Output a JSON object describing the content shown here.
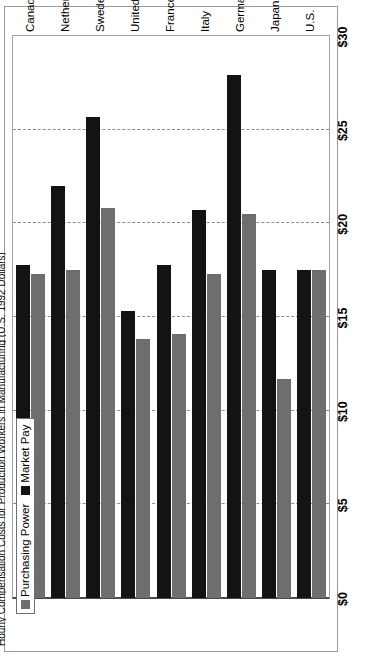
{
  "chart": {
    "title": "Hourly Compensation Costs for Production Workers in Manufacturing (U.S. 1992 Dollars)",
    "legend": {
      "position": "top-left",
      "items": [
        {
          "label": "Purchasing Power",
          "color": "#6e6e6e",
          "swatch": "legend-swatch-purchasing-power"
        },
        {
          "label": "Market Pay",
          "color": "#131313",
          "swatch": "legend-swatch-market-pay"
        }
      ]
    }
  },
  "chart_data": {
    "type": "bar",
    "orientation": "horizontal",
    "title": "Hourly Compensation Costs for Production Workers in Manufacturing (U.S. 1992 Dollars)",
    "xlabel": "",
    "ylabel": "",
    "grid": true,
    "legend_position": "top-left",
    "axis_ticks": [
      "$0",
      "$5",
      "$10",
      "$15",
      "$20",
      "$25",
      "$30"
    ],
    "tick_values": [
      0,
      5,
      10,
      15,
      20,
      25,
      30
    ],
    "xlim": [
      0,
      30
    ],
    "categories": [
      "U.S.",
      "Japan",
      "Germany",
      "Italy",
      "France",
      "United Kingdom",
      "Sweden",
      "Netherlands",
      "Canada"
    ],
    "series": [
      {
        "name": "Purchasing Power",
        "color": "#6e6e6e",
        "values": [
          17.5,
          11.7,
          20.5,
          17.3,
          14.1,
          13.8,
          20.8,
          17.5,
          17.3
        ]
      },
      {
        "name": "Market Pay",
        "color": "#131313",
        "values": [
          17.5,
          17.5,
          27.9,
          20.7,
          17.8,
          15.3,
          25.7,
          22.0,
          17.8
        ]
      }
    ]
  }
}
